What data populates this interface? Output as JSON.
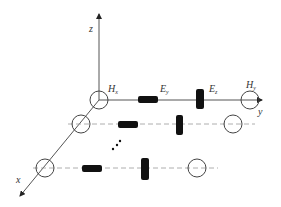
{
  "axes": {
    "z": "z",
    "y": "y",
    "x": "x"
  },
  "labels": {
    "hx": {
      "main": "H",
      "sub": "x"
    },
    "ey": {
      "main": "E",
      "sub": "y"
    },
    "ez": {
      "main": "E",
      "sub": "z"
    },
    "hy": {
      "main": "H",
      "sub": "y"
    }
  },
  "ellipsis": "⋰",
  "colors": {
    "line": "#555555",
    "dash": "#999999",
    "element": "#111111"
  }
}
